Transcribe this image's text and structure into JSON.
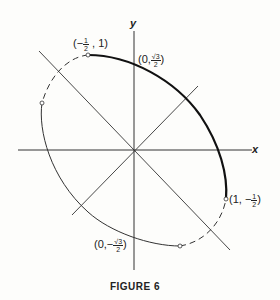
{
  "figure": {
    "caption": "FIGURE 6",
    "axes": {
      "x_label": "x",
      "y_label": "y"
    },
    "points": [
      {
        "id": "p1",
        "x_num": "1",
        "x_den": "2",
        "x_sign": "−",
        "y": "1",
        "open_paren": "(",
        "close_paren": ")",
        "sep": ","
      },
      {
        "id": "p2",
        "x": "0",
        "sep": ",",
        "y_num": "√3",
        "y_den": "2"
      },
      {
        "id": "p3",
        "x": "1",
        "sep": ",",
        "y_sign": "−",
        "y_num": "1",
        "y_den": "2"
      },
      {
        "id": "p4",
        "x": "0",
        "sep": ",",
        "y_sign": "−",
        "y_num": "√3",
        "y_den": "2"
      }
    ],
    "curve": "x² + xy + y² = 3/4 (rotated ellipse)",
    "colors": {
      "ink": "#222222",
      "background": "#fdfdfb"
    }
  }
}
